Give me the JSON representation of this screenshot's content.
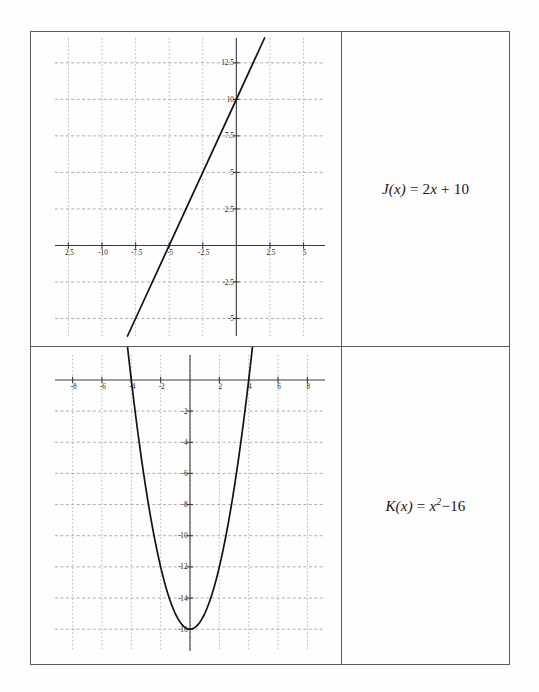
{
  "page": {
    "background_color": "#fdfdfd",
    "table_border_color": "#5a5a60"
  },
  "table": {
    "rows": [
      {
        "graph_cell_name": "graph-cell-j",
        "formula_cell_name": "formula-cell-j",
        "formula": {
          "function_name": "J",
          "argument": "x",
          "full_text": "J(x) = 2x + 10",
          "lhs": "J(x)",
          "equals": "=",
          "coefficient": "2",
          "variable": "x",
          "operator": "+",
          "constant": "10"
        }
      },
      {
        "graph_cell_name": "graph-cell-k",
        "formula_cell_name": "formula-cell-k",
        "formula": {
          "function_name": "K",
          "argument": "x",
          "full_text": "K(x) = x² − 16",
          "lhs": "K(x)",
          "equals": "=",
          "variable": "x",
          "exponent": "2",
          "operator": "−",
          "constant": "16"
        }
      }
    ]
  },
  "chart_data": [
    {
      "type": "line",
      "name": "graph-j",
      "title": "",
      "xlabel": "",
      "ylabel": "",
      "equation": "J(x) = 2x + 10",
      "slope": 2,
      "intercept": 10,
      "x_intercept": -5,
      "y_intercept": 10,
      "xlim": [
        -13.5,
        6.6
      ],
      "ylim": [
        -6.2,
        14.2
      ],
      "grid": true,
      "legend": "none",
      "xticks": [
        -12.5,
        -10,
        -7.5,
        -5,
        -2.5,
        2.5,
        5
      ],
      "xtick_labels": [
        "2.5",
        "-10",
        "-7.5",
        "-5",
        "-2.5",
        "2.5",
        "5"
      ],
      "yticks": [
        12.5,
        10,
        7.5,
        5,
        2.5,
        -2.5,
        -5
      ],
      "ytick_labels": [
        "12.5",
        "10",
        "7.5",
        "5",
        "2.5",
        "-2.5",
        "-5"
      ],
      "x_gridlines": [
        -12.5,
        -10,
        -7.5,
        -5,
        -2.5,
        0,
        2.5,
        5
      ],
      "y_gridlines": [
        12.5,
        10,
        7.5,
        5,
        2.5,
        0,
        -2.5,
        -5
      ],
      "x": [
        -8.1,
        2.1
      ],
      "values": [
        -6.2,
        14.2
      ]
    },
    {
      "type": "line",
      "name": "graph-k",
      "title": "",
      "xlabel": "",
      "ylabel": "",
      "equation": "K(x) = x² − 16",
      "vertex": [
        0,
        -16
      ],
      "x_intercepts": [
        -4,
        4
      ],
      "y_intercept": -16,
      "xlim": [
        -9.2,
        9.2
      ],
      "ylim": [
        -17.4,
        1.6
      ],
      "grid": true,
      "legend": "none",
      "xticks": [
        -8,
        -6,
        -4,
        -2,
        2,
        4,
        6,
        8
      ],
      "xtick_labels": [
        "-8",
        "-6",
        "-4",
        "-2",
        "2",
        "4",
        "6",
        "8"
      ],
      "yticks": [
        -2,
        -4,
        -6,
        -8,
        -10,
        -12,
        -14,
        -16
      ],
      "ytick_labels": [
        "-2",
        "-4",
        "-6",
        "-8",
        "-10",
        "-12",
        "-14",
        "-16"
      ],
      "x_gridlines": [
        -8,
        -6,
        -4,
        -2,
        0,
        2,
        4,
        6,
        8
      ],
      "y_gridlines": [
        -2,
        -4,
        -6,
        -8,
        -10,
        -12,
        -14,
        -16
      ],
      "x": [
        -4.4,
        4.4
      ],
      "values": [
        3.36,
        3.36
      ]
    }
  ]
}
